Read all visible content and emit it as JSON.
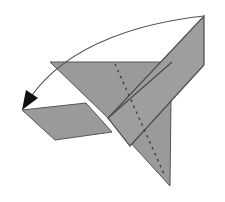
{
  "diagram": {
    "title": "Origami fold step: fold the top point down to the left along the arrow",
    "type": "origami-folding-instruction",
    "colors": {
      "paper": "#9a9a9a",
      "edge": "#555555",
      "crease": "#3f3f3f",
      "arrow": "#1a1a1a",
      "background": "#ffffff"
    },
    "elements": [
      {
        "name": "upper-wing-triangle",
        "kind": "paper-region"
      },
      {
        "name": "lower-left-flap",
        "kind": "paper-region"
      },
      {
        "name": "diagonal-band",
        "kind": "paper-region"
      },
      {
        "name": "bottom-point-triangle",
        "kind": "paper-region"
      },
      {
        "name": "dotted-fold-line",
        "kind": "valley-fold-line"
      },
      {
        "name": "fold-arrow",
        "kind": "curved-arrow",
        "from": "top-right point",
        "to": "left point"
      }
    ]
  }
}
